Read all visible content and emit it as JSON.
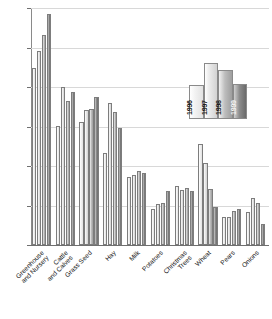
{
  "chart_data": {
    "type": "bar",
    "title": "",
    "xlabel": "",
    "ylabel": "",
    "ylim": [
      0,
      600
    ],
    "ytick_values": [
      0,
      100,
      200,
      300,
      400,
      500,
      600
    ],
    "ytick_labels": [
      "$0",
      "$100",
      "$200",
      "$300",
      "$400",
      "$500",
      "$600"
    ],
    "grid": true,
    "legend_position": "inside-upper-right",
    "categories": [
      "Greenhouse and Nursery",
      "Cattle and Calves",
      "Grass Seed",
      "Hay",
      "Milk",
      "Potatoes",
      "Christmas Trees",
      "Wheat",
      "Pears",
      "Onions"
    ],
    "category_lines": [
      [
        "Greenhouse",
        "and Nursery"
      ],
      [
        "Cattle",
        "and Calves"
      ],
      [
        "Grass Seed"
      ],
      [
        "Hay"
      ],
      [
        "Milk"
      ],
      [
        "Potatoes"
      ],
      [
        "Christmas",
        "Trees"
      ],
      [
        "Wheat"
      ],
      [
        "Pears"
      ],
      [
        "Onions"
      ]
    ],
    "series": [
      {
        "name": "1996",
        "color": "#f2f2f2",
        "values": [
          448,
          302,
          312,
          233,
          172,
          92,
          150,
          257,
          72,
          84
        ]
      },
      {
        "name": "1997",
        "color": "#ededed",
        "values": [
          492,
          400,
          342,
          360,
          177,
          103,
          140,
          207,
          72,
          118
        ]
      },
      {
        "name": "1998",
        "color": "#aeaeae",
        "values": [
          532,
          364,
          345,
          336,
          187,
          107,
          144,
          142,
          85,
          106
        ]
      },
      {
        "name": "1999",
        "color": "#7a7a7a",
        "values": [
          585,
          388,
          374,
          295,
          182,
          138,
          138,
          95,
          92,
          52
        ]
      }
    ]
  },
  "legend": {
    "entries": [
      {
        "label": "1996",
        "height_pct": 60,
        "style": "s0",
        "text_style": "dark"
      },
      {
        "label": "1997",
        "height_pct": 100,
        "style": "s1",
        "text_style": "dark"
      },
      {
        "label": "1998",
        "height_pct": 88,
        "style": "s2",
        "text_style": "dark"
      },
      {
        "label": "1999",
        "height_pct": 62,
        "style": "s3",
        "text_style": "light"
      }
    ]
  },
  "colors": {
    "axis": "#6f6f6f",
    "grid": "#d8d8d8",
    "background": "#ffffff",
    "bar_outline": "#7d7d7d"
  }
}
